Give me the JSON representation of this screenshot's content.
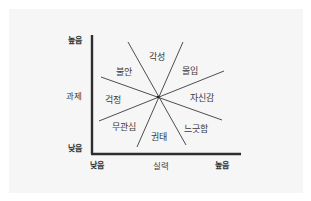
{
  "diagram": {
    "type": "flow-channel-model",
    "y_axis": {
      "label": "과제",
      "high": "높음",
      "low": "낮음"
    },
    "x_axis": {
      "label": "실력",
      "high": "높음",
      "low": "낮음"
    },
    "regions": [
      {
        "id": "arousal",
        "label": "각성"
      },
      {
        "id": "flow",
        "label": "몰입"
      },
      {
        "id": "control",
        "label": "자신감"
      },
      {
        "id": "relaxation",
        "label": "느긋함"
      },
      {
        "id": "boredom",
        "label": "권태"
      },
      {
        "id": "apathy",
        "label": "무관심"
      },
      {
        "id": "worry",
        "label": "걱정"
      },
      {
        "id": "anxiety",
        "label": "불안"
      }
    ],
    "colors": {
      "background": "#f6f6f6",
      "lines": "#3a3a3a",
      "axis": "#2e2e2e"
    }
  }
}
